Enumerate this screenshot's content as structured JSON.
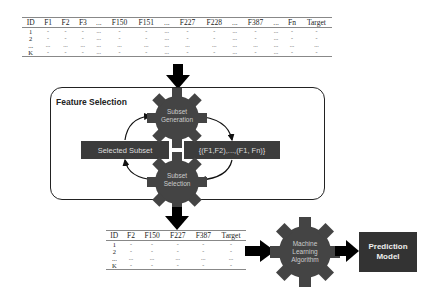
{
  "input_table": {
    "headers": [
      "ID",
      "F1",
      "F2",
      "F3",
      "...",
      "F150",
      "F151",
      "...",
      "F227",
      "F228",
      "...",
      "F387",
      "...",
      "Fn",
      "Target"
    ],
    "rows": [
      [
        "1",
        "-",
        "-",
        "-",
        "...",
        "-",
        "-",
        "...",
        "-",
        "-",
        "...",
        "-",
        "...",
        "-",
        "-"
      ],
      [
        "2",
        "-",
        "-",
        "-",
        "...",
        "-",
        "-",
        "...",
        "-",
        "-",
        "...",
        "-",
        "...",
        "-",
        "-"
      ],
      [
        "...",
        "...",
        "...",
        "...",
        "...",
        "...",
        "...",
        "...",
        "...",
        "...",
        "...",
        "...",
        "...",
        "...",
        "..."
      ],
      [
        "K",
        "-",
        "-",
        "-",
        "...",
        "-",
        "-",
        "...",
        "-",
        "-",
        "...",
        "-",
        "...",
        "-",
        "-"
      ]
    ]
  },
  "feature_selection": {
    "title": "Feature Selection",
    "gear_top": [
      "Subset",
      "Generation"
    ],
    "gear_bottom": [
      "Subset",
      "Selection"
    ],
    "left_bar": "Selected Subset",
    "right_bar": "{(F1,F2),...,(F1, Fn)}"
  },
  "output_table": {
    "headers": [
      "ID",
      "F2",
      "F150",
      "F227",
      "F387",
      "Target"
    ],
    "rows": [
      [
        "1",
        "-",
        "-",
        "-",
        "-",
        "-"
      ],
      [
        "2",
        "-",
        "-",
        "-",
        "-",
        "-"
      ],
      [
        "...",
        "...",
        "...",
        "...",
        "...",
        "..."
      ],
      [
        "K",
        "-",
        "-",
        "-",
        "-",
        "-"
      ]
    ]
  },
  "ml_gear": [
    "Machine",
    "Learning",
    "Algorithm"
  ],
  "prediction_model": [
    "Prediction",
    "Model"
  ],
  "colors": {
    "gear": "#444444",
    "bar": "#3c3c3c",
    "box": "#333333",
    "arrow": "#000000"
  }
}
